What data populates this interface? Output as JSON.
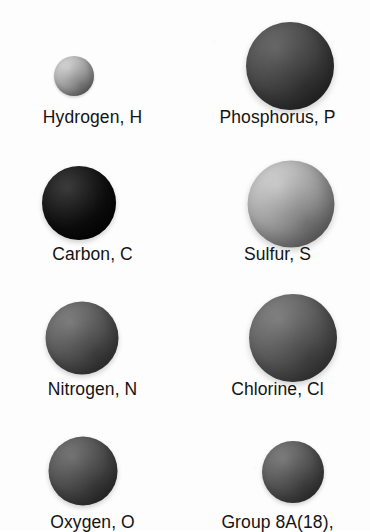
{
  "figure": {
    "background_color": "#fdfdfd",
    "text_color": "#141414",
    "columns": 2,
    "rows": 4
  },
  "atoms": [
    {
      "id": "hydrogen",
      "label": "Hydrogen, H",
      "element_name": "Hydrogen",
      "symbol": "H",
      "diameter_px": 40,
      "center_x": 74,
      "center_y": 76,
      "label_y": 107,
      "column": 0,
      "row": 0,
      "fill_light": "#d7d7d7",
      "fill_mid": "#b4b4b4",
      "fill_dark": "#8d8d8d",
      "shade_description": "light gray sphere, smallest"
    },
    {
      "id": "phosphorus",
      "label": "Phosphorus, P",
      "element_name": "Phosphorus",
      "symbol": "P",
      "diameter_px": 88,
      "center_x": 290,
      "center_y": 66,
      "label_y": 107,
      "column": 1,
      "row": 0,
      "fill_light": "#5e5e5e",
      "fill_mid": "#4a4a4a",
      "fill_dark": "#343434",
      "shade_description": "dark gray sphere, large"
    },
    {
      "id": "carbon",
      "label": "Carbon, C",
      "element_name": "Carbon",
      "symbol": "C",
      "diameter_px": 74,
      "center_x": 79,
      "center_y": 203,
      "label_y": 244,
      "column": 0,
      "row": 1,
      "fill_light": "#2a2a2a",
      "fill_mid": "#141414",
      "fill_dark": "#050505",
      "shade_description": "near-black sphere"
    },
    {
      "id": "sulfur",
      "label": "Sulfur, S",
      "element_name": "Sulfur",
      "symbol": "S",
      "diameter_px": 87,
      "center_x": 291,
      "center_y": 204,
      "label_y": 244,
      "column": 1,
      "row": 1,
      "fill_light": "#d2d2d2",
      "fill_mid": "#b0b0b0",
      "fill_dark": "#8a8a8a",
      "shade_description": "light gray sphere, large"
    },
    {
      "id": "nitrogen",
      "label": "Nitrogen, N",
      "element_name": "Nitrogen",
      "symbol": "N",
      "diameter_px": 73,
      "center_x": 82,
      "center_y": 338,
      "label_y": 379,
      "column": 0,
      "row": 2,
      "fill_light": "#777777",
      "fill_mid": "#5e5e5e",
      "fill_dark": "#464646",
      "shade_description": "medium gray sphere"
    },
    {
      "id": "chlorine",
      "label": "Chlorine, Cl",
      "element_name": "Chlorine",
      "symbol": "Cl",
      "diameter_px": 88,
      "center_x": 293,
      "center_y": 338,
      "label_y": 379,
      "column": 1,
      "row": 2,
      "fill_light": "#7b7b7b",
      "fill_mid": "#626262",
      "fill_dark": "#4a4a4a",
      "shade_description": "medium gray sphere, large"
    },
    {
      "id": "oxygen",
      "label": "Oxygen, O",
      "element_name": "Oxygen",
      "symbol": "O",
      "diameter_px": 69,
      "center_x": 83,
      "center_y": 471,
      "label_y": 512,
      "column": 0,
      "row": 3,
      "fill_light": "#6d6d6d",
      "fill_mid": "#545454",
      "fill_dark": "#3c3c3c",
      "shade_description": "medium-dark gray sphere"
    },
    {
      "id": "group-8a",
      "label": "Group 8A(18),",
      "element_name": "Group 8A(18),",
      "symbol": "",
      "diameter_px": 62,
      "center_x": 293,
      "center_y": 472,
      "label_y": 512,
      "column": 1,
      "row": 3,
      "fill_light": "#767676",
      "fill_mid": "#5c5c5c",
      "fill_dark": "#444444",
      "shade_description": "medium gray sphere, small"
    }
  ]
}
